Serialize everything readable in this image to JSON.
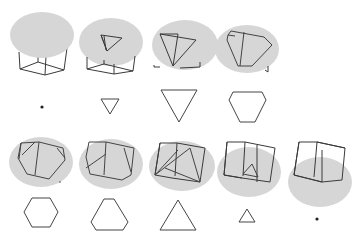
{
  "colors": {
    "background": "#ffffff",
    "plane": "#d6d6d6",
    "edge": "#3a3a3a",
    "section": "#444444"
  },
  "rows": [
    {
      "panels": [
        {
          "id": "p1",
          "section_shape": "point",
          "label": "vertex"
        },
        {
          "id": "p2",
          "section_shape": "triangle",
          "label": "small triangle"
        },
        {
          "id": "p3",
          "section_shape": "triangle",
          "label": "large triangle"
        },
        {
          "id": "p4",
          "section_shape": "hexagon",
          "label": "truncated triangle"
        }
      ]
    },
    {
      "panels": [
        {
          "id": "p5",
          "section_shape": "hexagon",
          "label": "regular hexagon"
        },
        {
          "id": "p6",
          "section_shape": "hexagon",
          "label": "truncated triangle"
        },
        {
          "id": "p7",
          "section_shape": "triangle",
          "label": "large triangle"
        },
        {
          "id": "p8",
          "section_shape": "triangle",
          "label": "small triangle"
        },
        {
          "id": "p9",
          "section_shape": "point",
          "label": "vertex"
        }
      ]
    }
  ]
}
